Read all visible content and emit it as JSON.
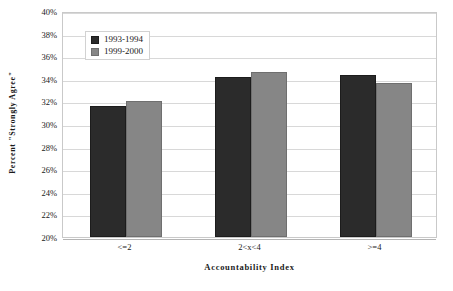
{
  "chart_data": {
    "type": "bar",
    "title": "",
    "subtitle": "",
    "xlabel": "Accountability Index",
    "ylabel": "Percent \"Strongly Agree\"",
    "categories": [
      "<=2",
      "2<x<4",
      ">=4"
    ],
    "series": [
      {
        "name": "1993-1994",
        "color": "#2b2b2b",
        "values": [
          31.6,
          34.2,
          34.3
        ]
      },
      {
        "name": "1999-2000",
        "color": "#868686",
        "values": [
          32.0,
          34.6,
          33.6
        ]
      }
    ],
    "ylim": [
      20,
      40
    ],
    "ytick_step": 2,
    "ytick_labels": [
      "40%",
      "38%",
      "36%",
      "34%",
      "32%",
      "30%",
      "28%",
      "26%",
      "24%",
      "22%",
      "20%"
    ],
    "ytick_values": [
      40,
      38,
      36,
      34,
      32,
      30,
      28,
      26,
      24,
      22,
      20
    ],
    "grid": true,
    "grid_axis": "y",
    "legend_position": "upper-left-inside",
    "plot_background": "#ffffff",
    "plot_border_color": "#c9c9c9",
    "gridline_color": "#d8d8d8"
  }
}
